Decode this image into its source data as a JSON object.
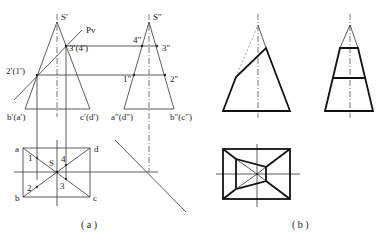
{
  "figure_a": {
    "caption": "( a )",
    "front_view": {
      "apex_label": "S′",
      "plane_label": "Pv",
      "point_upper_label": "3′(4′)",
      "point_lower_label": "2′(1′)",
      "base_left_label": "b′(a′)",
      "base_right_label": "c′(d′)"
    },
    "side_view": {
      "apex_label": "S″",
      "p4_label": "4″",
      "p3_label": "3″",
      "p1_label": "1″",
      "p2_label": "2″",
      "base_left_label": "a″(d″)",
      "base_right_label": "b″(c″)"
    },
    "top_view": {
      "a_label": "a",
      "b_label": "b",
      "c_label": "c",
      "d_label": "d",
      "s_label": "S",
      "p1_label": "1",
      "p2_label": "2",
      "p3_label": "3",
      "p4_label": "4"
    }
  },
  "figure_b": {
    "caption": "( b )"
  }
}
